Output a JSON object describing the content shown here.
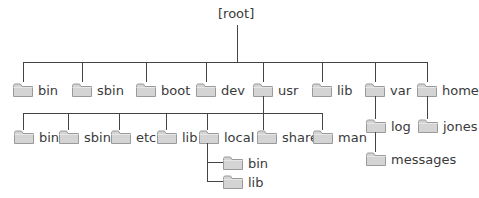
{
  "diagram": {
    "type": "directory-tree",
    "root": {
      "label": "[root]"
    },
    "level1": [
      {
        "label": "bin"
      },
      {
        "label": "sbin"
      },
      {
        "label": "boot"
      },
      {
        "label": "dev"
      },
      {
        "label": "usr"
      },
      {
        "label": "lib"
      },
      {
        "label": "var"
      },
      {
        "label": "home"
      }
    ],
    "usr_children": [
      {
        "label": "bin"
      },
      {
        "label": "sbin"
      },
      {
        "label": "etc"
      },
      {
        "label": "lib"
      },
      {
        "label": "local"
      },
      {
        "label": "share"
      },
      {
        "label": "man"
      }
    ],
    "local_children": [
      {
        "label": "bin"
      },
      {
        "label": "lib"
      }
    ],
    "var_children": [
      {
        "label": "log"
      }
    ],
    "log_children": [
      {
        "label": "messages"
      }
    ],
    "home_children": [
      {
        "label": "jones"
      }
    ],
    "colors": {
      "line": "#444444",
      "folder_fill": "#d4d4d4",
      "folder_stroke": "#9a9a9a",
      "text": "#3a3a3a"
    }
  }
}
